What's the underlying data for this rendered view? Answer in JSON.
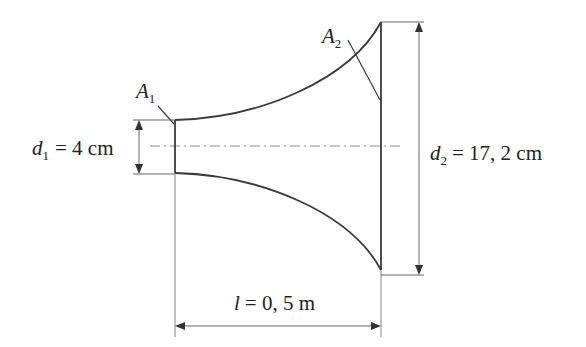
{
  "diagram": {
    "labels": {
      "A1": {
        "symbol": "A",
        "subscript": "1"
      },
      "A2": {
        "symbol": "A",
        "subscript": "2"
      },
      "d1": {
        "symbol": "d",
        "subscript": "1",
        "value": "= 4 cm"
      },
      "d2": {
        "symbol": "d",
        "subscript": "2",
        "value": "= 17, 2 cm"
      },
      "l": {
        "symbol": "l",
        "value": "= 0, 5 m"
      }
    },
    "colors": {
      "outline": "#3a3a3a",
      "dimension": "#555555",
      "centerline": "#888888"
    }
  }
}
